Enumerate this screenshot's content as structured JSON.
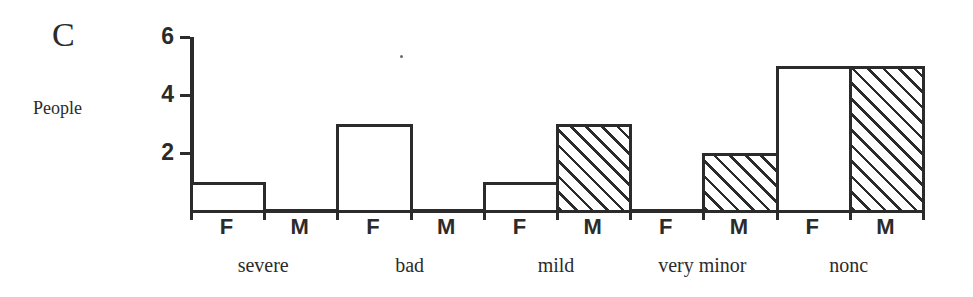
{
  "panel": {
    "letter": "C"
  },
  "chart_data": {
    "type": "bar",
    "title": "C",
    "xlabel": "",
    "ylabel": "People",
    "ylim": [
      0,
      6
    ],
    "ytick_labels": [
      "2",
      "4",
      "6"
    ],
    "ytick_values": [
      2,
      4,
      6
    ],
    "grid": false,
    "legend": "none",
    "categories": [
      "severe",
      "bad",
      "mild",
      "very minor",
      "nonc"
    ],
    "group_labels": [
      "F",
      "M"
    ],
    "series": [
      {
        "name": "F",
        "fill": "open",
        "values": [
          1,
          3,
          1,
          0,
          5
        ]
      },
      {
        "name": "M",
        "fill": "hatched",
        "values": [
          0,
          0,
          3,
          2,
          5
        ]
      }
    ],
    "bars": [
      {
        "category": "severe",
        "sex": "F",
        "value": 1,
        "fill": "open"
      },
      {
        "category": "severe",
        "sex": "M",
        "value": 0,
        "fill": "hatched"
      },
      {
        "category": "bad",
        "sex": "F",
        "value": 3,
        "fill": "open"
      },
      {
        "category": "bad",
        "sex": "M",
        "value": 0,
        "fill": "hatched"
      },
      {
        "category": "mild",
        "sex": "F",
        "value": 1,
        "fill": "open"
      },
      {
        "category": "mild",
        "sex": "M",
        "value": 3,
        "fill": "hatched"
      },
      {
        "category": "very minor",
        "sex": "F",
        "value": 0,
        "fill": "open"
      },
      {
        "category": "very minor",
        "sex": "M",
        "value": 2,
        "fill": "hatched"
      },
      {
        "category": "nonc",
        "sex": "F",
        "value": 5,
        "fill": "open"
      },
      {
        "category": "nonc",
        "sex": "M",
        "value": 5,
        "fill": "hatched"
      }
    ],
    "colors": {
      "ink": "#2b2b2b",
      "background": "#ffffff"
    }
  }
}
